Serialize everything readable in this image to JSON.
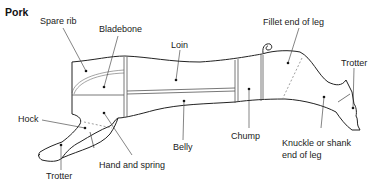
{
  "title": "Pork",
  "cuts": [
    {
      "id": "spare-rib",
      "label": "Spare rib"
    },
    {
      "id": "bladebone",
      "label": "Bladebone"
    },
    {
      "id": "loin",
      "label": "Loin"
    },
    {
      "id": "fillet-end-of-leg",
      "label": "Fillet end of leg"
    },
    {
      "id": "trotter-hind",
      "label": "Trotter"
    },
    {
      "id": "hock",
      "label": "Hock"
    },
    {
      "id": "belly",
      "label": "Belly"
    },
    {
      "id": "chump",
      "label": "Chump"
    },
    {
      "id": "knuckle",
      "label_line1": "Knuckle or shank",
      "label_line2": "end of leg"
    },
    {
      "id": "trotter-fore",
      "label": "Trotter"
    },
    {
      "id": "hand-and-spring",
      "label": "Hand and spring"
    }
  ]
}
